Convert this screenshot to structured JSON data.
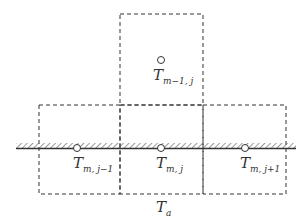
{
  "diagram": {
    "title": "",
    "cells": [
      {
        "id": "top",
        "label_main": "T",
        "label_sub": "m−1, j"
      },
      {
        "id": "bottom-left",
        "label_main": "T",
        "label_sub": "m, j−1"
      },
      {
        "id": "bottom-center",
        "label_main": "T",
        "label_sub": "m, j"
      },
      {
        "id": "bottom-right",
        "label_main": "T",
        "label_sub": "m, j+1"
      }
    ],
    "ambient": {
      "label_main": "T",
      "label_sub": "a"
    },
    "colors": {
      "line": "#333333",
      "hatch": "#555555",
      "background": "#ffffff"
    }
  }
}
